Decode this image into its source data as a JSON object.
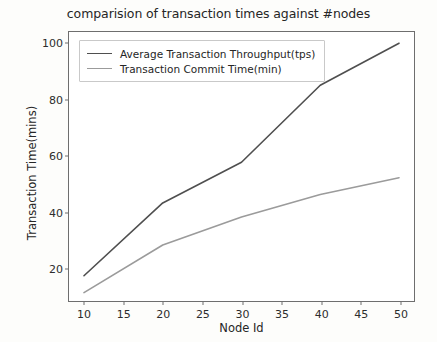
{
  "chart_data": {
    "type": "line",
    "title": "comparision of transaction times against #nodes",
    "xlabel": "Node Id",
    "ylabel": "Transaction Time(mins)",
    "x": [
      10,
      20,
      30,
      40,
      50
    ],
    "series": [
      {
        "name": "Average Transaction Throughput(tps)",
        "color": "#4f4f4f",
        "values": [
          17,
          43,
          57.5,
          85,
          100
        ]
      },
      {
        "name": "Transaction Commit Time(min)",
        "color": "#9b9b9b",
        "values": [
          11,
          28,
          38,
          46,
          52
        ]
      }
    ],
    "xlim": [
      8.1,
      51.9
    ],
    "ylim": [
      8.0,
      104.0
    ],
    "xticks": [
      10,
      15,
      20,
      25,
      30,
      35,
      40,
      45,
      50
    ],
    "xtick_labels": [
      "10",
      "15",
      "20",
      "25",
      "30",
      "35",
      "40",
      "45",
      "50"
    ],
    "yticks": [
      20,
      40,
      60,
      80,
      100
    ],
    "ytick_labels": [
      "20",
      "40",
      "60",
      "80",
      "100"
    ],
    "grid": false,
    "legend_position": "upper left",
    "background_color": "#ffffff",
    "figure_color": "#fdfdfb",
    "axis_color": "#6e6e6e"
  }
}
